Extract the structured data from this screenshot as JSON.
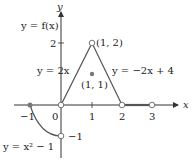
{
  "figure": {
    "function_label": "y = f(x)",
    "axes": {
      "x_label": "x",
      "y_label": "y",
      "x_ticks": [
        "−1",
        "0",
        "1",
        "2",
        "3"
      ],
      "y_ticks": [
        "2",
        "−1"
      ]
    },
    "pieces": [
      {
        "label": "y = x² − 1",
        "domain": "-1 ≤ x < 0"
      },
      {
        "label": "y = 2x",
        "domain": "0 ≤ x < 1"
      },
      {
        "label": "y = −2x + 4",
        "domain": "1 < x ≤ 2"
      },
      {
        "label": "y = 0",
        "domain": "2 < x < 3"
      }
    ],
    "points": {
      "open_top": "(1, 2)",
      "filled_mid": "(1, 1)"
    },
    "colors": {
      "axis": "#333333",
      "curve": "#555555",
      "open_point_stroke": "#666666",
      "filled_point": "#777777"
    }
  }
}
